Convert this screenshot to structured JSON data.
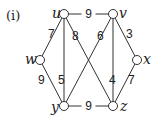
{
  "figure_label": "(i)",
  "nodes": [
    {
      "id": "u",
      "label": "u",
      "x": 64,
      "y": 14
    },
    {
      "id": "v",
      "label": "v",
      "x": 113,
      "y": 14
    },
    {
      "id": "w",
      "label": "w",
      "x": 40,
      "y": 60
    },
    {
      "id": "x",
      "label": "x",
      "x": 137,
      "y": 60
    },
    {
      "id": "y",
      "label": "y",
      "x": 64,
      "y": 106
    },
    {
      "id": "z",
      "label": "z",
      "x": 113,
      "y": 106
    }
  ],
  "edges": [
    {
      "from": "u",
      "to": "v",
      "weight": "9"
    },
    {
      "from": "u",
      "to": "w",
      "weight": "7"
    },
    {
      "from": "u",
      "to": "z",
      "weight": "8"
    },
    {
      "from": "u",
      "to": "y",
      "weight": "5"
    },
    {
      "from": "v",
      "to": "y",
      "weight": "6"
    },
    {
      "from": "v",
      "to": "z",
      "weight": "4"
    },
    {
      "from": "v",
      "to": "x",
      "weight": "3"
    },
    {
      "from": "w",
      "to": "y",
      "weight": "9"
    },
    {
      "from": "x",
      "to": "z",
      "weight": "7"
    },
    {
      "from": "y",
      "to": "z",
      "weight": "9"
    }
  ]
}
